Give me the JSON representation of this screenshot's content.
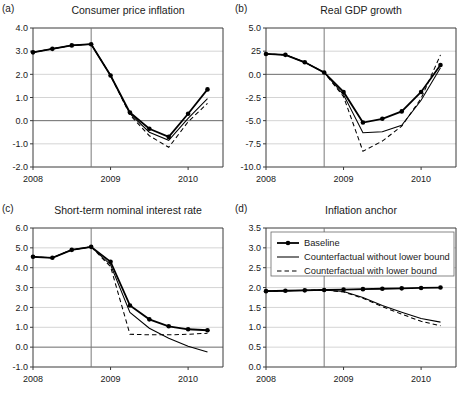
{
  "figure": {
    "x_tick_labels": [
      "2008",
      "2009",
      "2010"
    ],
    "x_tick_values": [
      2008.0,
      2009.0,
      2010.0
    ],
    "xlim": [
      2008.0,
      2010.45
    ],
    "vertical_reference_line": 2008.75,
    "series_names": [
      "Baseline",
      "Counterfactual without lower bound",
      "Counterfactual with lower bound"
    ],
    "legend_position": "panel-d top-left",
    "grid": "horizontal"
  },
  "legend": {
    "items": [
      {
        "label": "Baseline",
        "style": "solid-thick-with-markers"
      },
      {
        "label": "Counterfactual without lower bound",
        "style": "solid-thin"
      },
      {
        "label": "Counterfactual with lower bound",
        "style": "dashed-thin"
      }
    ]
  },
  "chart_data": [
    {
      "panel": "(a)",
      "type": "line",
      "title": "Consumer price inflation",
      "xlabel": "",
      "ylabel": "",
      "xlim": [
        2008.0,
        2010.45
      ],
      "ylim": [
        -2.0,
        4.0
      ],
      "ytick_labels": [
        "4.0",
        "3.0",
        "2.0",
        "1.0",
        "0.0",
        "-1.0",
        "-2.0"
      ],
      "ytick_values": [
        4.0,
        3.0,
        2.0,
        1.0,
        0.0,
        -1.0,
        -2.0
      ],
      "x": [
        2008.0,
        2008.25,
        2008.5,
        2008.75,
        2009.0,
        2009.25,
        2009.5,
        2009.75,
        2010.0,
        2010.25
      ],
      "series": [
        {
          "name": "Baseline",
          "values": [
            2.95,
            3.1,
            3.25,
            3.3,
            1.95,
            0.35,
            -0.35,
            -0.7,
            0.3,
            1.35
          ],
          "markers": true
        },
        {
          "name": "Counterfactual without lower bound",
          "values": [
            2.95,
            3.1,
            3.25,
            3.3,
            1.95,
            0.3,
            -0.5,
            -0.85,
            0.1,
            0.95
          ],
          "markers": false
        },
        {
          "name": "Counterfactual with lower bound",
          "values": [
            2.95,
            3.1,
            3.25,
            3.3,
            1.95,
            0.25,
            -0.65,
            -1.15,
            -0.05,
            0.75
          ],
          "markers": false
        }
      ]
    },
    {
      "panel": "(b)",
      "type": "line",
      "title": "Real GDP growth",
      "xlabel": "",
      "ylabel": "",
      "xlim": [
        2008.0,
        2010.45
      ],
      "ylim": [
        -10.0,
        5.0
      ],
      "ytick_labels": [
        "5.0",
        "25",
        "0.0",
        "-2.5",
        "-5.0",
        "-7.5",
        "-10.0"
      ],
      "ytick_values": [
        5.0,
        2.5,
        0.0,
        -2.5,
        -5.0,
        -7.5,
        -10.0
      ],
      "x": [
        2008.0,
        2008.25,
        2008.5,
        2008.75,
        2009.0,
        2009.25,
        2009.5,
        2009.75,
        2010.0,
        2010.25
      ],
      "series": [
        {
          "name": "Baseline",
          "values": [
            2.2,
            2.1,
            1.3,
            0.2,
            -1.9,
            -5.2,
            -4.8,
            -4.0,
            -1.9,
            1.0
          ],
          "markers": true
        },
        {
          "name": "Counterfactual without lower bound",
          "values": [
            2.2,
            2.1,
            1.3,
            0.2,
            -2.2,
            -6.3,
            -6.2,
            -5.5,
            -2.8,
            0.7
          ],
          "markers": false
        },
        {
          "name": "Counterfactual with lower bound",
          "values": [
            2.2,
            2.1,
            1.3,
            0.2,
            -2.4,
            -8.3,
            -7.2,
            -5.6,
            -2.6,
            2.1
          ],
          "markers": false
        }
      ]
    },
    {
      "panel": "(c)",
      "type": "line",
      "title": "Short-term nominal interest rate",
      "xlabel": "",
      "ylabel": "",
      "xlim": [
        2008.0,
        2010.45
      ],
      "ylim": [
        -1.0,
        6.0
      ],
      "ytick_labels": [
        "6.0",
        "5.0",
        "4.0",
        "3.0",
        "2.0",
        "1.0",
        "0.0",
        "-1.0"
      ],
      "ytick_values": [
        6.0,
        5.0,
        4.0,
        3.0,
        2.0,
        1.0,
        0.0,
        -1.0
      ],
      "x": [
        2008.0,
        2008.25,
        2008.5,
        2008.75,
        2009.0,
        2009.25,
        2009.5,
        2009.75,
        2010.0,
        2010.25
      ],
      "series": [
        {
          "name": "Baseline",
          "values": [
            4.55,
            4.5,
            4.9,
            5.05,
            4.3,
            2.1,
            1.4,
            1.05,
            0.9,
            0.85
          ],
          "markers": true
        },
        {
          "name": "Counterfactual without lower bound",
          "values": [
            4.55,
            4.5,
            4.9,
            5.05,
            4.15,
            1.75,
            0.95,
            0.45,
            0.05,
            -0.25
          ],
          "markers": false
        },
        {
          "name": "Counterfactual with lower bound",
          "values": [
            4.55,
            4.5,
            4.9,
            5.05,
            4.05,
            0.65,
            0.62,
            0.62,
            0.65,
            0.7
          ],
          "markers": false
        }
      ]
    },
    {
      "panel": "(d)",
      "type": "line",
      "title": "Inflation anchor",
      "xlabel": "",
      "ylabel": "",
      "xlim": [
        2008.0,
        2010.45
      ],
      "ylim": [
        0.0,
        3.5
      ],
      "ytick_labels": [
        "3.5",
        "3.0",
        "2.5",
        "2.0",
        "1.5",
        "1.0",
        "0.5",
        "0.0"
      ],
      "ytick_values": [
        3.5,
        3.0,
        2.5,
        2.0,
        1.5,
        1.0,
        0.5,
        0.0
      ],
      "x": [
        2008.0,
        2008.25,
        2008.5,
        2008.75,
        2009.0,
        2009.25,
        2009.5,
        2009.75,
        2010.0,
        2010.25
      ],
      "series": [
        {
          "name": "Baseline",
          "values": [
            1.91,
            1.92,
            1.93,
            1.94,
            1.95,
            1.96,
            1.97,
            1.98,
            1.99,
            2.0
          ],
          "markers": true
        },
        {
          "name": "Counterfactual without lower bound",
          "values": [
            1.91,
            1.92,
            1.93,
            1.94,
            1.9,
            1.75,
            1.55,
            1.38,
            1.22,
            1.13
          ],
          "markers": false
        },
        {
          "name": "Counterfactual with lower bound",
          "values": [
            1.91,
            1.92,
            1.93,
            1.94,
            1.89,
            1.73,
            1.52,
            1.33,
            1.15,
            1.04
          ],
          "markers": false
        }
      ]
    }
  ]
}
